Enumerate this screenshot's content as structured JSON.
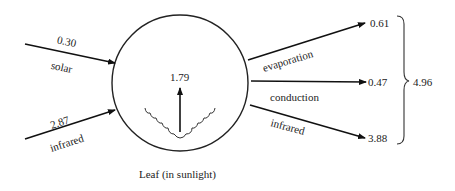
{
  "diagram": {
    "title": "Leaf (in sunlight)",
    "inputs": [
      {
        "label": "solar",
        "value": "0.30"
      },
      {
        "label": "infrared",
        "value": "2.87"
      }
    ],
    "internal": {
      "value": "1.79"
    },
    "outputs": [
      {
        "label": "evaporation",
        "value": "0.61"
      },
      {
        "label": "conduction",
        "value": "0.47"
      },
      {
        "label": "infrared",
        "value": "3.88"
      }
    ],
    "output_total": "4.96"
  }
}
